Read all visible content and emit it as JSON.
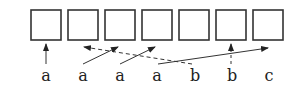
{
  "diagram": {
    "cells": [
      {
        "index": 0
      },
      {
        "index": 1
      },
      {
        "index": 2
      },
      {
        "index": 3
      },
      {
        "index": 4
      },
      {
        "index": 5
      },
      {
        "index": 6
      }
    ],
    "labels": [
      "a",
      "a",
      "a",
      "a",
      "b",
      "b",
      "c"
    ],
    "arrows": [
      {
        "from_label": 0,
        "to_cell": 0,
        "style": "solid"
      },
      {
        "from_label": 4,
        "to_cell": 1,
        "style": "dashed"
      },
      {
        "from_label": 1,
        "to_cell": 2,
        "style": "solid"
      },
      {
        "from_label": 2,
        "to_cell": 3,
        "style": "solid"
      },
      {
        "from_label": 3,
        "to_cell": 6,
        "style": "solid"
      },
      {
        "from_label": 5,
        "to_cell": 5,
        "style": "dashed"
      }
    ],
    "colors": {
      "stroke": "#333333",
      "background": "#ffffff"
    }
  }
}
